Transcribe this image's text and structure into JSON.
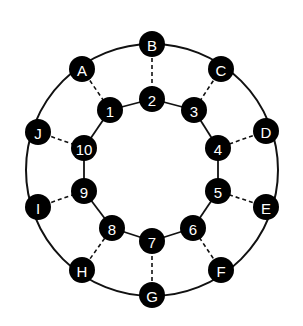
{
  "diagram": {
    "type": "graph",
    "colors": {
      "node_fill": "#000000",
      "node_text": "#ffffff",
      "edge": "#111111",
      "background": "#ffffff"
    },
    "outer_ring": {
      "center": [
        152,
        170
      ],
      "radius": 126,
      "nodes": [
        {
          "id": "B",
          "label": "B",
          "x": 152,
          "y": 44
        },
        {
          "id": "C",
          "label": "C",
          "x": 221,
          "y": 69
        },
        {
          "id": "D",
          "label": "D",
          "x": 266,
          "y": 131
        },
        {
          "id": "E",
          "label": "E",
          "x": 266,
          "y": 207
        },
        {
          "id": "F",
          "label": "F",
          "x": 221,
          "y": 270
        },
        {
          "id": "G",
          "label": "G",
          "x": 152,
          "y": 295
        },
        {
          "id": "H",
          "label": "H",
          "x": 82,
          "y": 270
        },
        {
          "id": "I",
          "label": "I",
          "x": 38,
          "y": 207
        },
        {
          "id": "J",
          "label": "J",
          "x": 38,
          "y": 132
        },
        {
          "id": "A",
          "label": "A",
          "x": 82,
          "y": 69
        }
      ]
    },
    "inner_ring": {
      "nodes": [
        {
          "id": "1",
          "label": "1",
          "x": 110,
          "y": 110
        },
        {
          "id": "2",
          "label": "2",
          "x": 152,
          "y": 99
        },
        {
          "id": "3",
          "label": "3",
          "x": 194,
          "y": 110
        },
        {
          "id": "4",
          "label": "4",
          "x": 218,
          "y": 148
        },
        {
          "id": "5",
          "label": "5",
          "x": 218,
          "y": 191
        },
        {
          "id": "6",
          "label": "6",
          "x": 193,
          "y": 228
        },
        {
          "id": "7",
          "label": "7",
          "x": 152,
          "y": 241
        },
        {
          "id": "8",
          "label": "8",
          "x": 112,
          "y": 228
        },
        {
          "id": "9",
          "label": "9",
          "x": 84,
          "y": 191
        },
        {
          "id": "10",
          "label": "10",
          "x": 84,
          "y": 148
        }
      ],
      "edges": [
        [
          "1",
          "2"
        ],
        [
          "2",
          "3"
        ],
        [
          "3",
          "4"
        ],
        [
          "4",
          "5"
        ],
        [
          "5",
          "6"
        ],
        [
          "6",
          "7"
        ],
        [
          "7",
          "8"
        ],
        [
          "8",
          "9"
        ],
        [
          "9",
          "10"
        ],
        [
          "10",
          "1"
        ]
      ]
    },
    "spokes": [
      [
        "A",
        "1"
      ],
      [
        "B",
        "2"
      ],
      [
        "C",
        "3"
      ],
      [
        "D",
        "4"
      ],
      [
        "E",
        "5"
      ],
      [
        "F",
        "6"
      ],
      [
        "G",
        "7"
      ],
      [
        "H",
        "8"
      ],
      [
        "I",
        "9"
      ],
      [
        "J",
        "10"
      ]
    ],
    "node_radius": 13
  }
}
